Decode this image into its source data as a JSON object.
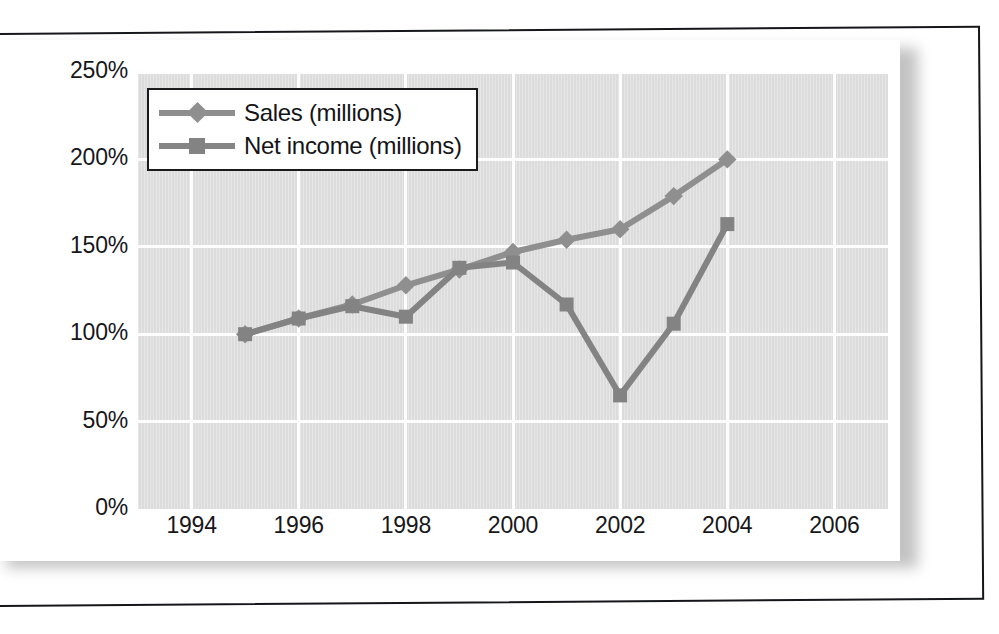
{
  "chart_data": {
    "type": "line",
    "title": "",
    "subtitle": "",
    "xlabel": "",
    "ylabel": "",
    "x": [
      1995,
      1996,
      1997,
      1998,
      1999,
      2000,
      2001,
      2002,
      2003,
      2004
    ],
    "xlim": [
      1993,
      2007
    ],
    "ylim": [
      0,
      250
    ],
    "y_tick_labels": [
      "250%",
      "200%",
      "150%",
      "100%",
      "50%",
      "0%"
    ],
    "y_tick_values": [
      250,
      200,
      150,
      100,
      50,
      0
    ],
    "x_tick_labels": [
      "1994",
      "1996",
      "1998",
      "2000",
      "2002",
      "2004",
      "2006"
    ],
    "x_tick_values": [
      1994,
      1996,
      1998,
      2000,
      2002,
      2004,
      2006
    ],
    "grid": true,
    "legend_position": "top-left",
    "series": [
      {
        "name": "Sales (millions)",
        "marker": "diamond",
        "color": "#8f8f8f",
        "values": [
          100,
          109,
          117,
          128,
          137,
          147,
          154,
          160,
          179,
          200
        ]
      },
      {
        "name": "Net income (millions)",
        "marker": "square",
        "color": "#838383",
        "values": [
          100,
          109,
          116,
          110,
          138,
          141,
          117,
          65,
          106,
          163
        ]
      }
    ],
    "plot_background": "#dcdcdc",
    "gridline_color": "#fdfdfd",
    "text_color": "#17171a"
  },
  "legend": {
    "items": [
      {
        "label": "Sales (millions)",
        "marker": "diamond"
      },
      {
        "label": "Net income (millions)",
        "marker": "square"
      }
    ]
  },
  "axes": {
    "y_ticks": [
      "250%",
      "200%",
      "150%",
      "100%",
      "50%",
      "0%"
    ],
    "x_ticks": [
      "1994",
      "1996",
      "1998",
      "2000",
      "2002",
      "2004",
      "2006"
    ]
  }
}
